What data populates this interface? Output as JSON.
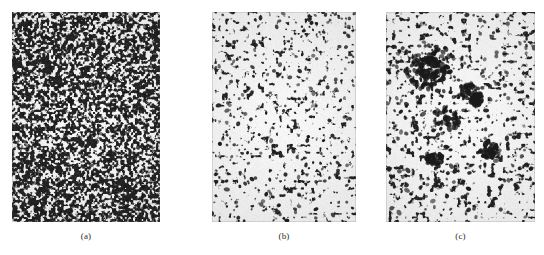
{
  "figure": {
    "background_color": "#ffffff",
    "ink_color": "#1a1a1a",
    "caption_color": "#2b2b2b",
    "panels": [
      {
        "id": "panel-a",
        "label": "(a)",
        "x": 12,
        "y": 12,
        "width": 148,
        "height": 210,
        "caption_y": 232,
        "texture": "dense-fine-speckle",
        "density": 0.52,
        "grain_scale": 2.1,
        "blob_count": 2100,
        "blob_min": 1.0,
        "blob_max": 3.4,
        "cluster_count": 0,
        "seed": 1771
      },
      {
        "id": "panel-b",
        "label": "(b)",
        "x": 212,
        "y": 12,
        "width": 144,
        "height": 210,
        "caption_y": 232,
        "texture": "sparse-filament-network",
        "density": 0.22,
        "grain_scale": 3.6,
        "blob_count": 760,
        "blob_min": 1.2,
        "blob_max": 4.2,
        "cluster_count": 0,
        "seed": 2459
      },
      {
        "id": "panel-c",
        "label": "(c)",
        "x": 386,
        "y": 12,
        "width": 149,
        "height": 210,
        "caption_y": 232,
        "texture": "sparse-network-with-agglomerates",
        "density": 0.24,
        "grain_scale": 3.8,
        "blob_count": 720,
        "blob_min": 1.2,
        "blob_max": 4.6,
        "cluster_count": 7,
        "seed": 3313
      }
    ]
  }
}
